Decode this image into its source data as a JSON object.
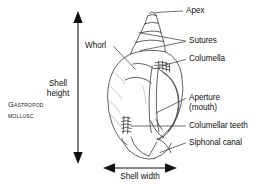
{
  "figure": {
    "subject": "Gastropod mollusc shell",
    "caption_line1": "Gastropod",
    "caption_line2": "mollusc",
    "background_color": "#ffffff",
    "ink_color": "#111111",
    "shell_outline_color": "#3a3a3a"
  },
  "dimensions": {
    "height_label_line1": "Shell",
    "height_label_line2": "height",
    "width_label": "Shell width",
    "height_arrow": "double-headed-vertical-arrow",
    "width_arrow": "double-headed-horizontal-arrow"
  },
  "labels": [
    {
      "id": "apex",
      "text": "Apex",
      "text2": ""
    },
    {
      "id": "sutures",
      "text": "Sutures",
      "text2": ""
    },
    {
      "id": "whorl",
      "text": "Whorl",
      "text2": ""
    },
    {
      "id": "columella",
      "text": "Columella",
      "text2": ""
    },
    {
      "id": "aperture",
      "text": "Aperture",
      "text2": "(mouth)"
    },
    {
      "id": "columellar-teeth",
      "text": "Columellar teeth",
      "text2": ""
    },
    {
      "id": "siphonal-canal",
      "text": "Siphonal canal",
      "text2": ""
    }
  ]
}
